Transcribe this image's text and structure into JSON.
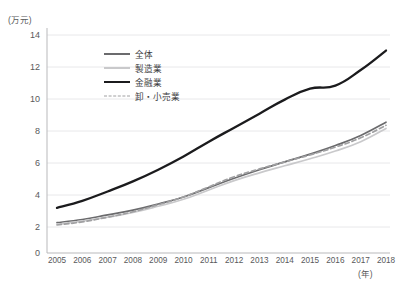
{
  "axes": {
    "y_unit_label": "(万元)",
    "x_unit_label": "(年)",
    "y_ticks": [
      "0",
      "2",
      "4",
      "6",
      "8",
      "10",
      "12",
      "14"
    ],
    "x_ticks": [
      "2005",
      "2006",
      "2007",
      "2008",
      "2009",
      "2010",
      "2011",
      "2012",
      "2013",
      "2014",
      "2015",
      "2016",
      "2017",
      "2018"
    ]
  },
  "legend": {
    "items": [
      {
        "label": "全体",
        "color": "#6b6b6d",
        "style": "solid"
      },
      {
        "label": "製造業",
        "color": "#c9c9cb",
        "style": "solid"
      },
      {
        "label": "金融業",
        "color": "#1b1b1d",
        "style": "solid"
      },
      {
        "label": "卸・小売業",
        "color": "#a0a0a2",
        "style": "dashed"
      }
    ]
  },
  "chart_data": {
    "type": "line",
    "title": "",
    "xlabel": "(年)",
    "ylabel": "(万元)",
    "xlim": [
      2005,
      2018
    ],
    "ylim": [
      0,
      14
    ],
    "ygrid": true,
    "ytick_step": 2,
    "legend_position": "inside-top-center",
    "categories": [
      2005,
      2006,
      2007,
      2008,
      2009,
      2010,
      2011,
      2012,
      2013,
      2014,
      2015,
      2016,
      2017,
      2018
    ],
    "series": [
      {
        "name": "全体",
        "color": "#6b6b6d",
        "style": "solid",
        "values": [
          1.95,
          2.15,
          2.45,
          2.75,
          3.15,
          3.6,
          4.2,
          4.8,
          5.35,
          5.85,
          6.35,
          6.9,
          7.55,
          8.4
        ]
      },
      {
        "name": "製造業",
        "color": "#c9c9cb",
        "style": "solid",
        "values": [
          1.85,
          2.05,
          2.3,
          2.6,
          3.0,
          3.45,
          4.05,
          4.65,
          5.15,
          5.6,
          6.05,
          6.55,
          7.15,
          8.0
        ]
      },
      {
        "name": "金融業",
        "color": "#1b1b1d",
        "style": "solid",
        "values": [
          2.9,
          3.35,
          3.95,
          4.6,
          5.35,
          6.2,
          7.15,
          8.05,
          8.95,
          9.85,
          10.55,
          10.75,
          11.75,
          13.0
        ]
      },
      {
        "name": "卸・小売業",
        "color": "#a0a0a2",
        "style": "dashed",
        "values": [
          1.8,
          2.0,
          2.3,
          2.65,
          3.1,
          3.6,
          4.25,
          4.9,
          5.4,
          5.85,
          6.3,
          6.8,
          7.4,
          8.2
        ]
      }
    ]
  }
}
